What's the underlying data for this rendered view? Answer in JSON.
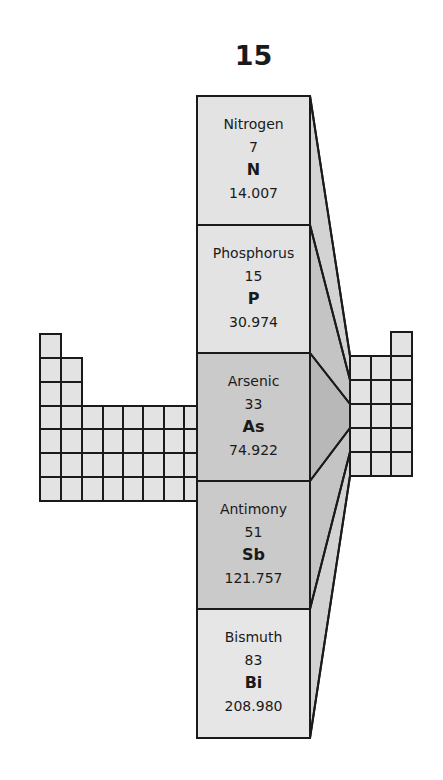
{
  "title": {
    "group_number": "15"
  },
  "colors": {
    "cell_light": "#e3e3e3",
    "cell_dark": "#c9c9c9",
    "border": "#1a1a1a",
    "side_light": "#d6d6d6",
    "side_dark": "#bdbdbd"
  },
  "elements": [
    {
      "name": "Nitrogen",
      "atomic_number": "7",
      "symbol": "N",
      "atomic_mass": "14.007",
      "shade": "light"
    },
    {
      "name": "Phosphorus",
      "atomic_number": "15",
      "symbol": "P",
      "atomic_mass": "30.974",
      "shade": "light"
    },
    {
      "name": "Arsenic",
      "atomic_number": "33",
      "symbol": "As",
      "atomic_mass": "74.922",
      "shade": "dark"
    },
    {
      "name": "Antimony",
      "atomic_number": "51",
      "symbol": "Sb",
      "atomic_mass": "121.757",
      "shade": "dark"
    },
    {
      "name": "Bismuth",
      "atomic_number": "83",
      "symbol": "Bi",
      "atomic_mass": "208.980",
      "shade": "light"
    }
  ]
}
